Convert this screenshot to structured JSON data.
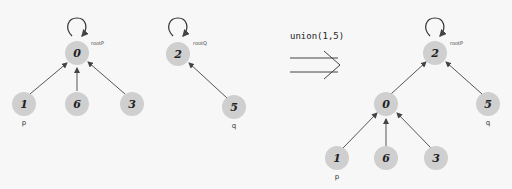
{
  "diagram": {
    "type": "union-find",
    "before": {
      "tree_p": {
        "root": {
          "id": "0",
          "tag": "rootP"
        },
        "children": [
          {
            "id": "1",
            "var": "p"
          },
          {
            "id": "6"
          },
          {
            "id": "3"
          }
        ]
      },
      "tree_q": {
        "root": {
          "id": "2",
          "tag": "rootQ"
        },
        "children": [
          {
            "id": "5",
            "var": "q"
          }
        ]
      }
    },
    "operation": "union(1,5)",
    "after": {
      "root": {
        "id": "2",
        "tag": "rootP"
      },
      "children": [
        {
          "id": "0",
          "children": [
            {
              "id": "1",
              "var": "p"
            },
            {
              "id": "6"
            },
            {
              "id": "3"
            }
          ]
        },
        {
          "id": "5",
          "var": "q"
        }
      ]
    }
  },
  "labels": {
    "n0": "0",
    "n1": "1",
    "n6": "6",
    "n3": "3",
    "n2": "2",
    "n5": "5",
    "rootP": "rootP",
    "rootQ": "rootQ",
    "p": "p",
    "q": "q",
    "op": "union(1,5)",
    "r2": "2",
    "r0": "0",
    "r5": "5",
    "r1": "1",
    "r6": "6",
    "r3": "3",
    "rootP2": "rootP",
    "p2": "p",
    "q2": "q"
  },
  "colors": {
    "node_fill": "#cfcfcf",
    "edge": "#555555",
    "background": "#f7f7f7"
  }
}
